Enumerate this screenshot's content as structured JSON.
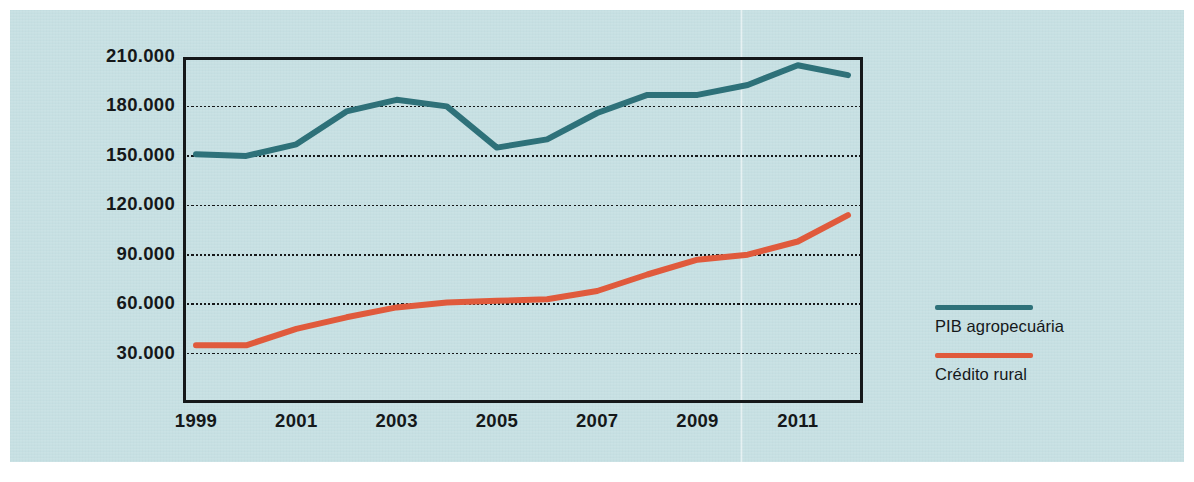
{
  "chart_data": {
    "type": "line",
    "title": "",
    "subtitle": "",
    "xlabel": "",
    "ylabel": "R$ milhões",
    "x": [
      1999,
      2000,
      2001,
      2002,
      2003,
      2004,
      2005,
      2006,
      2007,
      2008,
      2009,
      2010,
      2011,
      2012
    ],
    "xtick_labels": [
      "1999",
      "2001",
      "2003",
      "2005",
      "2007",
      "2009",
      "2011"
    ],
    "xtick_values": [
      1999,
      2001,
      2003,
      2005,
      2007,
      2009,
      2011
    ],
    "ytick_labels": [
      "210.000",
      "180.000",
      "150.000",
      "120.000",
      "90.000",
      "60.000",
      "30.000"
    ],
    "ytick_values": [
      210000,
      180000,
      150000,
      120000,
      90000,
      60000,
      30000
    ],
    "ylim": [
      0,
      210000
    ],
    "xlim": [
      1999,
      2012
    ],
    "grid": "horizontal-dotted",
    "legend_position": "right",
    "series": [
      {
        "name": "PIB agropecuária",
        "color": "#2e7179",
        "values": [
          151000,
          150000,
          157000,
          177000,
          184000,
          180000,
          155000,
          160000,
          176000,
          187000,
          187000,
          193000,
          205000,
          199000
        ]
      },
      {
        "name": "Crédito rural",
        "color": "#e05a3c",
        "values": [
          35000,
          35000,
          45000,
          52000,
          58000,
          61000,
          62000,
          63000,
          68000,
          78000,
          87000,
          90000,
          98000,
          114000
        ]
      }
    ]
  },
  "legend": {
    "items": [
      {
        "label": "PIB agropecuária",
        "color": "#2e7179"
      },
      {
        "label": "Crédito rural",
        "color": "#e05a3c"
      }
    ]
  },
  "colors": {
    "background": "#c5dfe2",
    "axis": "#15181a",
    "grid": "#15181a",
    "series_pib": "#2e7179",
    "series_credito": "#e05a3c"
  }
}
